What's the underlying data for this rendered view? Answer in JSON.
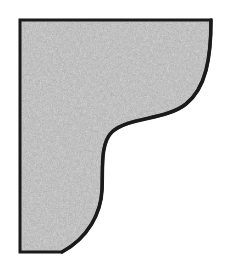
{
  "figure": {
    "name": "ogee-bracket-profile",
    "kind": "line-drawing",
    "alt_text": "Shaded quarter section with concave ogee curve",
    "canvas": {
      "width": 230,
      "height": 266
    },
    "colors": {
      "background": "#ffffff",
      "fill": "#a8a8a8",
      "fill_light": "#b4b4b4",
      "fill_dark": "#9a9a9a",
      "outline": "#1a1a1a"
    },
    "outline_width_px": 3,
    "geometry": {
      "corners": {
        "top_left": [
          20,
          20
        ],
        "top_right": [
          211,
          20
        ],
        "bottom_left": [
          20,
          252
        ]
      },
      "edges": [
        {
          "name": "top-edge",
          "from": [
            20,
            20
          ],
          "to": [
            211,
            20
          ],
          "type": "straight"
        },
        {
          "name": "left-edge",
          "from": [
            20,
            20
          ],
          "to": [
            20,
            252
          ],
          "type": "straight"
        },
        {
          "name": "bottom-edge",
          "from": [
            20,
            252
          ],
          "to": [
            62,
            252
          ],
          "type": "straight"
        }
      ],
      "ogee_curve": {
        "type": "cubic-bezier-chain",
        "description": "S-curve from top-right corner sweeping left then down to bottom edge",
        "path": "M 211 20 C 211 58 206 88 186 104 C 166 120 128 117 112 132 C 100 143 103 170 102 190 C 101 213 88 238 62 252",
        "inflection_point": [
          112,
          132
        ],
        "knee_point": [
          103,
          175
        ]
      },
      "outline_path": "M 20 20 L 211 20 C 211 58 206 88 186 104 C 166 120 128 117 112 132 C 100 143 103 170 102 190 C 101 213 88 238 62 252 L 20 252 Z"
    },
    "texture": {
      "style": "scanned-halftone-noise",
      "grain": "fine",
      "opacity": 0.5
    }
  }
}
